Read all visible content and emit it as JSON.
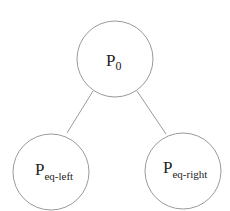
{
  "diagram": {
    "type": "tree",
    "nodes": [
      {
        "id": "root",
        "label": "P",
        "subscript": "0"
      },
      {
        "id": "left",
        "label": "P",
        "subscript": "eq-left"
      },
      {
        "id": "right",
        "label": "P",
        "subscript": "eq-right"
      }
    ],
    "edges": [
      {
        "from": "root",
        "to": "left"
      },
      {
        "from": "root",
        "to": "right"
      }
    ],
    "colors": {
      "stroke": "#9a9a9a",
      "text": "#222222",
      "background": "#ffffff"
    }
  }
}
